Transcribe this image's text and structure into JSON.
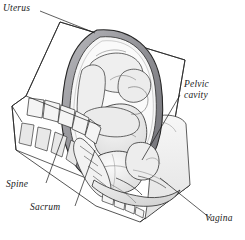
{
  "figure": {
    "view": "sagittal (side) section",
    "style": "pen-and-ink medical line drawing with gray wash shading",
    "background_color": "#ffffff",
    "ink_color": "#1a1a1a"
  },
  "labels": {
    "uterus": "Uterus",
    "pelvic_cavity_line1": "Pelvic",
    "pelvic_cavity_line2": "cavity",
    "spine": "Spine",
    "sacrum": "Sacrum",
    "vagina": "Vagina"
  },
  "anatomy": {
    "uterus_wall_color": "#8e8e93",
    "amniotic_cavity_color": "#f2f2f2",
    "fetus_fill": "#ebebeb",
    "bone_fill": "#f4f4f4",
    "soft_tissue_fill": "#e4e4e4",
    "parts": [
      "uterus",
      "amniotic cavity",
      "fetus in cephalic (head-down) presentation",
      "fetal head engaged in pelvic cavity",
      "fetal limbs flexed",
      "lumbar vertebrae",
      "intervertebral discs",
      "sacrum",
      "coccyx",
      "pelvic cavity",
      "vagina",
      "maternal abdominal wall"
    ],
    "vertebrae_count": 5,
    "coccyx_segments": 5
  }
}
